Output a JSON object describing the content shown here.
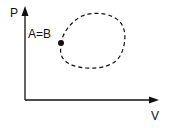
{
  "diagram": {
    "title": "",
    "axes": {
      "y_label": "P",
      "x_label": "V"
    },
    "point_label": "A=B",
    "curve_style": "dashed closed loop",
    "colors": {
      "ink": "#111111",
      "background": "#ffffff"
    }
  }
}
